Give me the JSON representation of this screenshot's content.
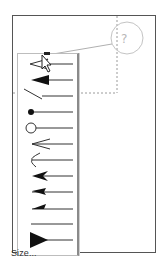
{
  "callout": {
    "symbol": "?",
    "icon": "help-callout-icon",
    "color": "#b8b8b8"
  },
  "menu": {
    "title": "Arrowhead style menu",
    "items": [
      {
        "id": "open-arrow",
        "icon": "open-arrowhead-icon",
        "selected": true
      },
      {
        "id": "filled-arrow",
        "icon": "filled-arrowhead-icon"
      },
      {
        "id": "slash",
        "icon": "slash-arrowhead-icon"
      },
      {
        "id": "dot",
        "icon": "dot-arrowhead-icon"
      },
      {
        "id": "open-circle",
        "icon": "open-circle-arrowhead-icon"
      },
      {
        "id": "open-v",
        "icon": "open-v-arrowhead-icon"
      },
      {
        "id": "curved-open",
        "icon": "curved-arrowhead-icon"
      },
      {
        "id": "stealth",
        "icon": "stealth-arrowhead-icon"
      },
      {
        "id": "half-arrow-upper",
        "icon": "half-arrowhead-icon"
      },
      {
        "id": "half-arrow-small",
        "icon": "small-half-arrowhead-icon"
      },
      {
        "id": "none",
        "icon": "no-arrowhead-icon"
      },
      {
        "id": "large-triangle",
        "icon": "large-triangle-arrowhead-icon"
      }
    ],
    "size_label": "Size..."
  },
  "colors": {
    "frame_border": "#555555",
    "menu_shadow": "#8a8a8a",
    "line": "#333333",
    "dashed": "#9a9a9a"
  }
}
